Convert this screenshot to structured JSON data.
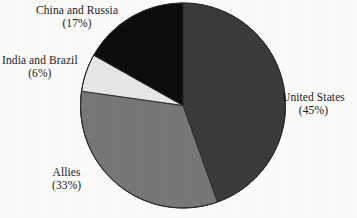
{
  "chart_data": {
    "type": "pie",
    "title": "",
    "subtitle": "",
    "xlabel": "",
    "ylabel": "",
    "legend_position": "none",
    "grid": false,
    "start_angle_deg": 0,
    "direction": "clockwise",
    "units": "percent",
    "categories": [
      "United States",
      "Allies",
      "India and Brazil",
      "China and Russia"
    ],
    "values": [
      45,
      33,
      6,
      17
    ],
    "colors": [
      "#3b3b3b",
      "#787878",
      "#e8e8e8",
      "#0d0d0d"
    ],
    "slices": [
      {
        "label": "United States",
        "value": 45,
        "percent_text": "(45%)",
        "color": "#3b3b3b",
        "label_side": "right"
      },
      {
        "label": "Allies",
        "value": 33,
        "percent_text": "(33%)",
        "color": "#787878",
        "label_side": "bottom-left"
      },
      {
        "label": "India and Brazil",
        "value": 6,
        "percent_text": "(6%)",
        "color": "#e8e8e8",
        "label_side": "left"
      },
      {
        "label": "China and Russia",
        "value": 17,
        "percent_text": "(17%)",
        "color": "#0d0d0d",
        "label_side": "top-left"
      }
    ]
  },
  "figure": {
    "background_color": "#fdfdfc",
    "text_color": "#1b1b1b",
    "outline_color": "#2a2a2a"
  }
}
